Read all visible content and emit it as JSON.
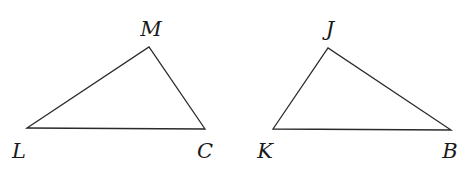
{
  "diagram": {
    "stroke_color": "#2a2a2a",
    "label_color": "#1a1a1a",
    "triangles": [
      {
        "name": "LMC",
        "vertices": [
          {
            "label": "L",
            "x": 27,
            "y": 128,
            "label_x": 19,
            "label_y": 152
          },
          {
            "label": "M",
            "x": 149,
            "y": 47,
            "label_x": 151,
            "label_y": 30
          },
          {
            "label": "C",
            "x": 205,
            "y": 129,
            "label_x": 205,
            "label_y": 152
          }
        ]
      },
      {
        "name": "KJB",
        "vertices": [
          {
            "label": "K",
            "x": 273,
            "y": 129,
            "label_x": 265,
            "label_y": 152
          },
          {
            "label": "J",
            "x": 328,
            "y": 48,
            "label_x": 330,
            "label_y": 30
          },
          {
            "label": "B",
            "x": 451,
            "y": 130,
            "label_x": 450,
            "label_y": 152
          }
        ]
      }
    ]
  }
}
